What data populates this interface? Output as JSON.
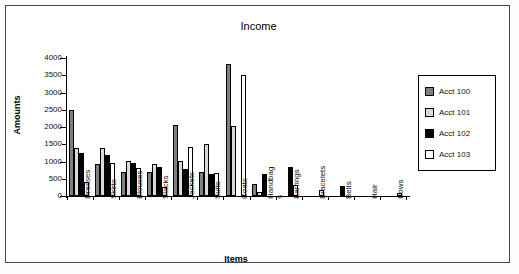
{
  "chart_data": {
    "type": "bar",
    "title": "Income",
    "xlabel": "Items",
    "ylabel": "Amounts",
    "ylim": [
      0,
      4000
    ],
    "yticks": [
      0,
      500,
      1000,
      1500,
      2000,
      2500,
      3000,
      3500,
      4000
    ],
    "ytick_labels": [
      "0",
      "500",
      "1000",
      "1500",
      "2000",
      "2500",
      "3000",
      "3500",
      "4000"
    ],
    "grid": false,
    "legend_position": "right",
    "categories": [
      "Dresses",
      "Skirts",
      "Blouses",
      "Slacks",
      "Jackets",
      "Suits",
      "Coats",
      "Handbags",
      "Earrings",
      "Bracelets",
      "Belts",
      "Hair",
      "Bows"
    ],
    "category_label_lines": [
      [
        "Dresses"
      ],
      [
        "Skirts"
      ],
      [
        "Blouses"
      ],
      [
        "Slacks"
      ],
      [
        "Jackets"
      ],
      [
        "Suits"
      ],
      [
        "Coats"
      ],
      [
        "Handbag",
        "s"
      ],
      [
        "Earrings"
      ],
      [
        "Bracelets"
      ],
      [
        "Belts"
      ],
      [
        "Hair"
      ],
      [
        "Bows"
      ]
    ],
    "series": [
      {
        "name": "Acct 100",
        "color": "#808080",
        "values": [
          2500,
          920,
          700,
          700,
          2070,
          690,
          3820,
          340,
          0,
          0,
          0,
          0,
          0
        ]
      },
      {
        "name": "Acct 101",
        "color": "#d9d9d9",
        "values": [
          1380,
          1400,
          1010,
          920,
          1010,
          1520,
          2030,
          130,
          0,
          0,
          0,
          0,
          0
        ]
      },
      {
        "name": "Acct 102",
        "color": "#000000",
        "values": [
          1250,
          1190,
          960,
          850,
          790,
          640,
          0,
          640,
          850,
          0,
          290,
          0,
          0
        ]
      },
      {
        "name": "Acct 103",
        "color": "#ffffff",
        "values": [
          400,
          970,
          810,
          260,
          1420,
          660,
          3520,
          0,
          330,
          175,
          0,
          0,
          90
        ]
      }
    ]
  },
  "legend": {
    "entries": [
      {
        "label": "Acct 100",
        "color": "#808080"
      },
      {
        "label": "Acct 101",
        "color": "#d9d9d9"
      },
      {
        "label": "Acct 102",
        "color": "#000000"
      },
      {
        "label": "Acct 103",
        "color": "#ffffff"
      }
    ]
  }
}
